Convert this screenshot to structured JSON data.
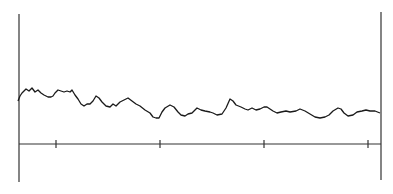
{
  "chart_data": {
    "type": "line",
    "title": "",
    "xlabel": "",
    "ylabel": "",
    "grid": false,
    "legend": null,
    "x_ticks": {
      "positions_px": [
        56,
        160,
        264,
        368
      ],
      "labels": []
    },
    "axes_px": {
      "left_x": 19,
      "left_top": 14,
      "left_bottom": 182,
      "right_x": 381,
      "right_top": 12,
      "right_bottom": 180,
      "baseline_y": 144
    },
    "series": [
      {
        "name": "trace",
        "color": "#1a1a1a",
        "points_px": [
          [
            18,
            101
          ],
          [
            20,
            96
          ],
          [
            22,
            93
          ],
          [
            26,
            89
          ],
          [
            29,
            91
          ],
          [
            32,
            88
          ],
          [
            35,
            92
          ],
          [
            38,
            90
          ],
          [
            41,
            93
          ],
          [
            44,
            95
          ],
          [
            48,
            97
          ],
          [
            51,
            97
          ],
          [
            53,
            96
          ],
          [
            55,
            93
          ],
          [
            58,
            90
          ],
          [
            61,
            91
          ],
          [
            64,
            92
          ],
          [
            67,
            91
          ],
          [
            70,
            92
          ],
          [
            72,
            90
          ],
          [
            75,
            95
          ],
          [
            78,
            99
          ],
          [
            81,
            104
          ],
          [
            84,
            106
          ],
          [
            87,
            104
          ],
          [
            90,
            104
          ],
          [
            93,
            101
          ],
          [
            96,
            96
          ],
          [
            99,
            98
          ],
          [
            102,
            102
          ],
          [
            106,
            106
          ],
          [
            110,
            107
          ],
          [
            113,
            104
          ],
          [
            116,
            106
          ],
          [
            120,
            102
          ],
          [
            124,
            100
          ],
          [
            128,
            98
          ],
          [
            132,
            101
          ],
          [
            136,
            104
          ],
          [
            140,
            106
          ],
          [
            145,
            110
          ],
          [
            150,
            113
          ],
          [
            153,
            117
          ],
          [
            156,
            118
          ],
          [
            159,
            118
          ],
          [
            162,
            112
          ],
          [
            165,
            108
          ],
          [
            170,
            105
          ],
          [
            174,
            107
          ],
          [
            178,
            112
          ],
          [
            181,
            115
          ],
          [
            185,
            116
          ],
          [
            188,
            114
          ],
          [
            192,
            113
          ],
          [
            197,
            108
          ],
          [
            201,
            110
          ],
          [
            205,
            111
          ],
          [
            210,
            112
          ],
          [
            213,
            113
          ],
          [
            217,
            115
          ],
          [
            222,
            114
          ],
          [
            226,
            108
          ],
          [
            230,
            99
          ],
          [
            233,
            101
          ],
          [
            236,
            105
          ],
          [
            241,
            107
          ],
          [
            245,
            109
          ],
          [
            248,
            110
          ],
          [
            252,
            108
          ],
          [
            256,
            110
          ],
          [
            260,
            109
          ],
          [
            264,
            107
          ],
          [
            267,
            107
          ],
          [
            273,
            111
          ],
          [
            277,
            113
          ],
          [
            281,
            112
          ],
          [
            286,
            111
          ],
          [
            290,
            112
          ],
          [
            296,
            111
          ],
          [
            300,
            109
          ],
          [
            305,
            111
          ],
          [
            310,
            114
          ],
          [
            315,
            117
          ],
          [
            320,
            118
          ],
          [
            325,
            117
          ],
          [
            329,
            115
          ],
          [
            333,
            111
          ],
          [
            338,
            108
          ],
          [
            341,
            109
          ],
          [
            344,
            113
          ],
          [
            348,
            116
          ],
          [
            353,
            115
          ],
          [
            357,
            112
          ],
          [
            362,
            111
          ],
          [
            366,
            110
          ],
          [
            370,
            111
          ],
          [
            375,
            111
          ],
          [
            380,
            113
          ]
        ]
      }
    ]
  }
}
